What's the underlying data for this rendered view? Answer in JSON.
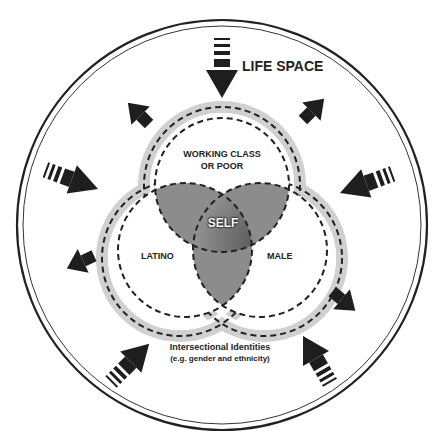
{
  "title": "LIFE SPACE",
  "circles": {
    "top": "WORKING CLASS\nOR POOR",
    "top_line1": "WORKING CLASS",
    "top_line2": "OR POOR",
    "left": "LATINO",
    "right": "MALE",
    "center": "SELF"
  },
  "caption": {
    "line1": "Intersectional Identities",
    "line2": "(e.g. gender and ethnicity)"
  },
  "colors": {
    "overlap": "#8c8c8c",
    "center": "#6a6a6a",
    "ring": "#d4d4d4",
    "arrow": "#1e1e1e"
  },
  "arrows": {
    "inward": [
      "top",
      "left",
      "right",
      "bottom-left",
      "bottom-right"
    ],
    "outward": [
      "upper-left",
      "upper-right",
      "lower-left",
      "lower-right"
    ]
  }
}
